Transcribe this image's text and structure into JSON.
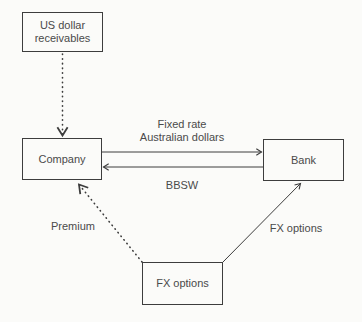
{
  "diagram": {
    "nodes": {
      "us_receivables": {
        "line1": "US dollar",
        "line2": "receivables"
      },
      "company": {
        "label": "Company"
      },
      "bank": {
        "label": "Bank"
      },
      "fx_options": {
        "label": "FX options"
      }
    },
    "edges": [
      {
        "from": "us_receivables",
        "to": "company",
        "style": "dotted",
        "label": ""
      },
      {
        "from": "company",
        "to": "bank",
        "style": "solid",
        "label_line1": "Fixed rate",
        "label_line2": "Australian dollars"
      },
      {
        "from": "bank",
        "to": "company",
        "style": "solid",
        "label": "BBSW"
      },
      {
        "from": "fx_options",
        "to": "company",
        "style": "dotted",
        "label": "Premium"
      },
      {
        "from": "fx_options",
        "to": "bank",
        "style": "solid",
        "label": "FX options"
      }
    ],
    "colors": {
      "background": "#fbfbf9",
      "line": "#3d3d3d",
      "text": "#4a4a4a"
    }
  }
}
